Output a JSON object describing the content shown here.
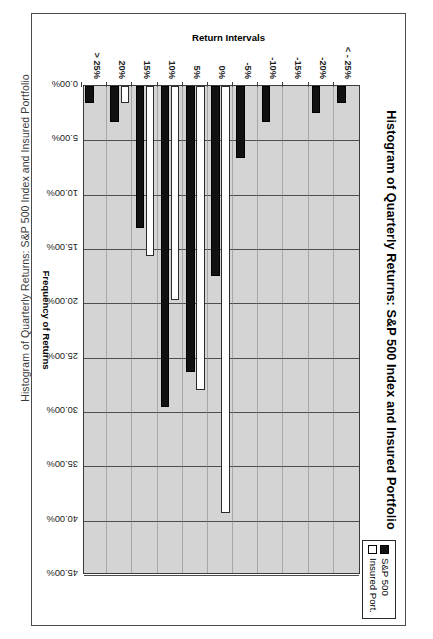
{
  "page": {
    "caption": "Histogram of Quarterly Returns: S&P 500 Index and Insured Portfolio"
  },
  "chart_data": {
    "type": "bar",
    "orientation": "horizontal",
    "title": "Histogram of Quarterly Returns:  S&P 500 Index and Insured Portfolio",
    "xlabel": "Frequency of Returns",
    "ylabel": "Return Intervals",
    "xlim": [
      0,
      45
    ],
    "xticks": [
      "0.00%",
      "5.00%",
      "10.00%",
      "15.00%",
      "20.00%",
      "25.00%",
      "30.00%",
      "35.00%",
      "40.00%",
      "45.00%"
    ],
    "xtick_values": [
      0,
      5,
      10,
      15,
      20,
      25,
      30,
      35,
      40,
      45
    ],
    "grid": true,
    "legend_position": "top-right",
    "categories": [
      "< - 25%",
      "-20%",
      "-15%",
      "-10%",
      "-5%",
      "0%",
      "5%",
      "10%",
      "15%",
      "20%",
      "> 25%"
    ],
    "series": [
      {
        "name": "S&P 500",
        "color": "#111111",
        "values": [
          1.6,
          2.5,
          0.0,
          3.3,
          6.6,
          17.5,
          26.3,
          29.5,
          13.1,
          3.3,
          1.6
        ]
      },
      {
        "name": "Insured Port.",
        "color": "#ffffff",
        "values": [
          0.0,
          0.0,
          0.0,
          0.0,
          0.0,
          39.3,
          28.0,
          19.7,
          15.6,
          1.6,
          0.0
        ]
      }
    ]
  },
  "legend": {
    "items": [
      {
        "label": "S&P 500",
        "swatch": "black"
      },
      {
        "label": "Insured Port.",
        "swatch": "white"
      }
    ]
  }
}
